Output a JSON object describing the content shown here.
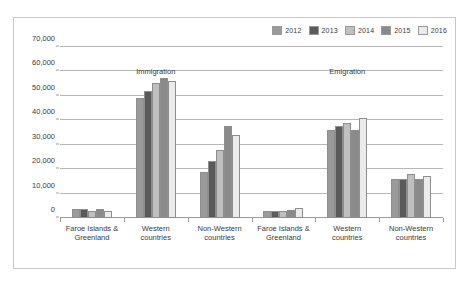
{
  "chart_data": {
    "type": "bar",
    "title": "",
    "subtitle": "",
    "xlabel": "",
    "ylabel": "",
    "ylim": [
      0,
      70000
    ],
    "ytick_labels": [
      "0",
      "10,000",
      "20,000",
      "30,000",
      "40,000",
      "50,000",
      "60,000",
      "70,000"
    ],
    "ytick_values": [
      0,
      10000,
      20000,
      30000,
      40000,
      50000,
      60000,
      70000
    ],
    "grid": true,
    "legend_position": "top-right",
    "legend_entries": [
      "2012",
      "2013",
      "2014",
      "2015",
      "2016"
    ],
    "series": [
      {
        "name": "2012",
        "color": "#9a9a9a",
        "values": [
          3500,
          49000,
          19000,
          2900,
          36000,
          16000
        ]
      },
      {
        "name": "2013",
        "color": "#5a5a5a",
        "values": [
          3600,
          52000,
          23200,
          2900,
          37600,
          15900
        ]
      },
      {
        "name": "2014",
        "color": "#c0c0c0",
        "values": [
          2700,
          55300,
          28000,
          2900,
          38900,
          18000
        ]
      },
      {
        "name": "2015",
        "color": "#8a8a8a",
        "values": [
          3700,
          57200,
          37500,
          3100,
          36000,
          16000
        ]
      },
      {
        "name": "2016",
        "color": "#ebebeb",
        "values": [
          2700,
          56100,
          34000,
          4000,
          41000,
          17000
        ]
      }
    ],
    "sections": [
      {
        "label": "Immigration",
        "categories": [
          "Faroe Islands &\nGreenland",
          "Western\ncountries",
          "Non-Western\ncountries"
        ]
      },
      {
        "label": "Emigration",
        "categories": [
          "Faroe Islands &\nGreenland",
          "Western\ncountries",
          "Non-Western\ncountries"
        ]
      }
    ],
    "categories": [
      "Faroe Islands &\nGreenland",
      "Western\ncountries",
      "Non-Western\ncountries",
      "Faroe Islands &\nGreenland",
      "Western\ncountries",
      "Non-Western\ncountries"
    ]
  }
}
